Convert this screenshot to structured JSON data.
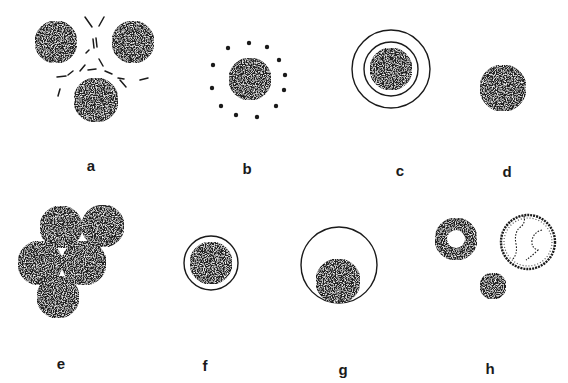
{
  "figure": {
    "background": "#ffffff",
    "ink_color": "#1a1a1a",
    "fill_color": "#222222",
    "speckle_color": "#e8e8e8",
    "panels": [
      {
        "id": "a",
        "label": "a",
        "label_pos": [
          91,
          165
        ],
        "description": "Three stippled cells separated by broken dashed lines"
      },
      {
        "id": "b",
        "label": "b",
        "label_pos": [
          247,
          168
        ],
        "description": "Stippled cell surrounded by a ring of dots"
      },
      {
        "id": "c",
        "label": "c",
        "label_pos": [
          400,
          170
        ],
        "description": "Stippled cell surrounded by two concentric rings"
      },
      {
        "id": "d",
        "label": "d",
        "label_pos": [
          507,
          171
        ],
        "description": "Single stippled cell"
      },
      {
        "id": "e",
        "label": "e",
        "label_pos": [
          61,
          363
        ],
        "description": "Cluster of five stippled cells"
      },
      {
        "id": "f",
        "label": "f",
        "label_pos": [
          205,
          365
        ],
        "description": "Stippled cell inside a single close ring"
      },
      {
        "id": "g",
        "label": "g",
        "label_pos": [
          343,
          369
        ],
        "description": "Stippled cell resting at the bottom of a large ring"
      },
      {
        "id": "h",
        "label": "h",
        "label_pos": [
          490,
          368
        ],
        "description": "Cells of varying appearance: hollow-centered, light with irregular lines, and small dense"
      }
    ],
    "shapes": {
      "a_cells": [
        [
          56,
          42,
          21
        ],
        [
          133,
          42,
          21
        ],
        [
          96,
          100,
          22
        ]
      ],
      "a_dashes": [
        [
          85,
          17,
          92,
          27
        ],
        [
          104,
          17,
          99,
          26
        ],
        [
          93,
          39,
          94,
          48
        ],
        [
          96,
          38,
          97,
          47
        ],
        [
          89,
          50,
          86,
          53
        ],
        [
          99,
          59,
          103,
          66
        ],
        [
          85,
          65,
          80,
          71
        ],
        [
          88,
          70,
          96,
          69
        ],
        [
          105,
          71,
          112,
          74
        ],
        [
          118,
          78,
          124,
          79
        ],
        [
          120,
          80,
          126,
          87
        ],
        [
          140,
          80,
          148,
          78
        ],
        [
          57,
          77,
          66,
          76
        ],
        [
          68,
          75,
          73,
          71
        ],
        [
          60,
          89,
          58,
          96
        ]
      ],
      "b_cell": [
        250,
        79,
        21
      ],
      "b_dots": [
        [
          228,
          48
        ],
        [
          249,
          43
        ],
        [
          267,
          47
        ],
        [
          279,
          60
        ],
        [
          285,
          75
        ],
        [
          284,
          90
        ],
        [
          276,
          106
        ],
        [
          257,
          117
        ],
        [
          236,
          115
        ],
        [
          221,
          106
        ],
        [
          212,
          88
        ],
        [
          213,
          65
        ]
      ],
      "c_cell": [
        391,
        69,
        21
      ],
      "c_rings": [
        [
          391,
          69,
          27
        ],
        [
          391,
          69,
          39
        ]
      ],
      "d_cell": [
        503,
        88,
        23
      ],
      "e_cells": [
        [
          61,
          227,
          21
        ],
        [
          103,
          226,
          21
        ],
        [
          40,
          263,
          22
        ],
        [
          84,
          263,
          22
        ],
        [
          58,
          297,
          21
        ]
      ],
      "f_cell": [
        211,
        263,
        21
      ],
      "f_ring": [
        211,
        263,
        27
      ],
      "g_cell": [
        338,
        281,
        22
      ],
      "g_ring": [
        339,
        265,
        38
      ],
      "h_hollow_cell": [
        456,
        239,
        21,
        9
      ],
      "h_light_cell": [
        528,
        242,
        27
      ],
      "h_small_cell": [
        493,
        286,
        13
      ]
    }
  }
}
